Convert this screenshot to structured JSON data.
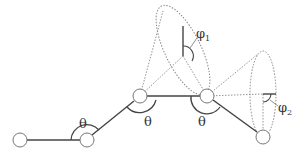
{
  "diagram": {
    "type": "polymer-chain-bond-angle-torsion",
    "labels": {
      "theta_1": "θ",
      "theta_2": "θ",
      "theta_3": "θ",
      "phi_1": "φ",
      "phi_1_sub": "1",
      "phi_2": "φ",
      "phi_2_sub": "2"
    },
    "atoms": [
      {
        "id": 1,
        "x": 20,
        "y": 140
      },
      {
        "id": 2,
        "x": 87,
        "y": 140
      },
      {
        "id": 3,
        "x": 140,
        "y": 96
      },
      {
        "id": 4,
        "x": 207,
        "y": 96
      },
      {
        "id": 5,
        "x": 263,
        "y": 137
      }
    ],
    "colors": {
      "line": "#444444",
      "dotted": "#777777",
      "atom_fill": "#ffffff",
      "atom_stroke": "#777777"
    }
  }
}
